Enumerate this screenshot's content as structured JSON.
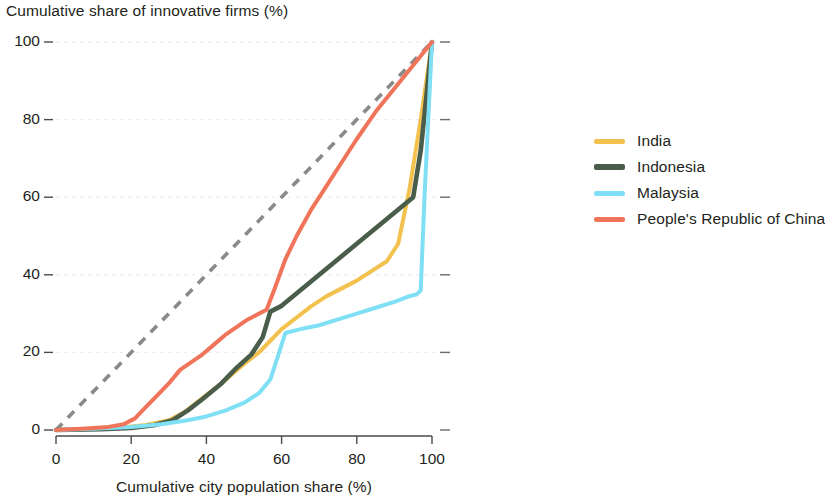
{
  "chart_data": {
    "type": "line",
    "title": "",
    "subtitle": "",
    "xlabel": "Cumulative city population share (%)",
    "ylabel": "Cumulative share of innovative firms (%)",
    "xlim": [
      0,
      100
    ],
    "ylim": [
      0,
      100
    ],
    "xticks": [
      "0",
      "20",
      "40",
      "60",
      "80",
      "100"
    ],
    "yticks": [
      "0",
      "20",
      "40",
      "60",
      "80",
      "100"
    ],
    "grid": "horizontal-faint",
    "legend_position": "right",
    "annotations": [
      {
        "name": "equality-line",
        "label": "line of equality",
        "style": "dashed",
        "color": "#8a8a8a",
        "from": [
          0,
          0
        ],
        "to": [
          100,
          100
        ]
      }
    ],
    "series": [
      {
        "name": "India",
        "color": "#f2c14e",
        "x": [
          0,
          10,
          18,
          24,
          30,
          34,
          38,
          44,
          50,
          54,
          57,
          60,
          64,
          68,
          72,
          76,
          80,
          84,
          88,
          91,
          94,
          97,
          100
        ],
        "y": [
          0,
          0.3,
          0.7,
          1.3,
          2.5,
          4.5,
          7.5,
          12,
          17,
          20,
          23,
          26,
          29,
          32,
          34.5,
          36.5,
          38.5,
          41,
          43.5,
          48,
          62,
          80,
          100
        ]
      },
      {
        "name": "Indonesia",
        "color": "#4a5d4a",
        "x": [
          0,
          12,
          20,
          26,
          31,
          35,
          39,
          44,
          48,
          52,
          55,
          57,
          60,
          65,
          70,
          75,
          80,
          85,
          90,
          95,
          97,
          100
        ],
        "y": [
          0,
          0.2,
          0.5,
          1.2,
          2.5,
          5,
          8,
          12,
          16,
          19.5,
          24,
          30.5,
          32,
          36,
          40,
          44,
          48,
          52,
          56,
          60,
          72,
          100
        ]
      },
      {
        "name": "Malaysia",
        "color": "#7fe0f5",
        "x": [
          0,
          10,
          20,
          28,
          35,
          40,
          45,
          50,
          54,
          57,
          59,
          61,
          65,
          70,
          75,
          80,
          85,
          90,
          94,
          96,
          97,
          98,
          100
        ],
        "y": [
          0,
          0.3,
          0.8,
          1.5,
          2.5,
          3.5,
          5,
          7,
          9.5,
          13,
          19,
          25,
          26,
          27,
          28.5,
          30,
          31.5,
          33,
          34.5,
          35,
          36,
          60,
          100
        ]
      },
      {
        "name": "People's Republic of China",
        "color": "#f0745a",
        "x": [
          0,
          8,
          14,
          18,
          21,
          24,
          27,
          30,
          33,
          36,
          39,
          42,
          45,
          48,
          51,
          54,
          56,
          58,
          61,
          64,
          68,
          72,
          76,
          80,
          85,
          90,
          95,
          100
        ],
        "y": [
          0,
          0.4,
          0.8,
          1.5,
          3,
          6,
          9,
          12,
          15.5,
          17.5,
          19.5,
          22,
          24.5,
          26.5,
          28.5,
          30,
          31,
          36,
          44,
          50,
          57,
          63,
          69,
          75,
          82,
          88,
          94,
          100
        ]
      }
    ]
  },
  "legend": {
    "items": [
      {
        "label": "India",
        "color": "#f2c14e",
        "thick": false
      },
      {
        "label": "Indonesia",
        "color": "#4a5d4a",
        "thick": true
      },
      {
        "label": "Malaysia",
        "color": "#7fe0f5",
        "thick": false
      },
      {
        "label": "People's Republic of China",
        "color": "#f0745a",
        "thick": false
      }
    ]
  },
  "axes": {
    "y_title": "Cumulative share of innovative firms (%)",
    "x_title": "Cumulative city population share (%)",
    "y_ticks": [
      "100",
      "80",
      "60",
      "40",
      "20",
      "0"
    ],
    "x_ticks": [
      "0",
      "20",
      "40",
      "60",
      "80",
      "100"
    ]
  }
}
